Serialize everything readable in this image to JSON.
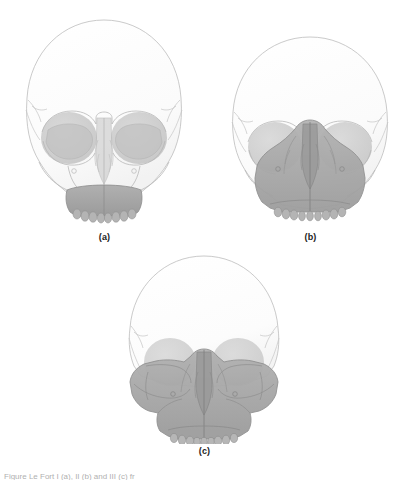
{
  "figure": {
    "background_color": "#ffffff",
    "caption_truncated": "Figure  Le Fort I (a), II (b) and III (c) fr",
    "panels": [
      {
        "id": "a",
        "label": "(a)",
        "view": "anterior skull",
        "pattern_name": "Le Fort I",
        "shaded_region": "maxillary alveolar arch and lower maxilla",
        "shade_extent": "low transverse band above the dental arch"
      },
      {
        "id": "b",
        "label": "(b)",
        "view": "anterior skull",
        "pattern_name": "Le Fort II",
        "shaded_region": "pyramidal central midface including nasal bones, medial orbital rims and maxilla",
        "shade_extent": "pyramidal, apex at nasofrontal region"
      },
      {
        "id": "c",
        "label": "(c)",
        "view": "anterior skull",
        "pattern_name": "Le Fort III",
        "shaded_region": "entire midface including zygomas, orbits and nasal complex",
        "shade_extent": "full craniofacial disjunction across both zygomatic processes"
      }
    ],
    "colors": {
      "cranium_fill": "#fcfcfc",
      "bone_outline": "#b6b6b6",
      "orbit_shade": "#c9c9c9",
      "midface_shade": "#a9a9a9",
      "dental_arch_shade": "#a3a3a3",
      "label_text": "#1c1c1c"
    }
  }
}
